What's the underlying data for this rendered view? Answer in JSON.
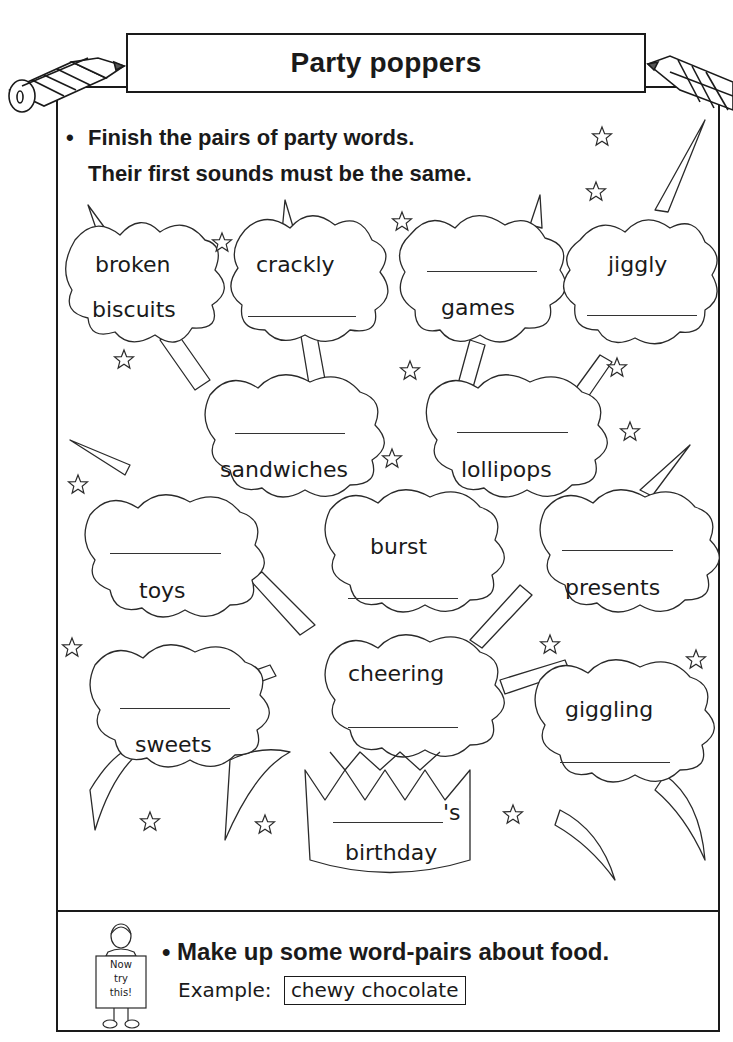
{
  "header": {
    "title": "Party poppers"
  },
  "instructions": {
    "bullet": "•",
    "line1": "Finish the pairs of party words.",
    "line2": "Their first sounds must be the same."
  },
  "bursts": [
    {
      "id": "broken-biscuits",
      "words": [
        "broken",
        "biscuits"
      ],
      "blank": null
    },
    {
      "id": "crackly",
      "words": [
        "crackly"
      ],
      "blank": "second"
    },
    {
      "id": "games",
      "words": [
        "games"
      ],
      "blank": "first"
    },
    {
      "id": "jiggly",
      "words": [
        "jiggly"
      ],
      "blank": "second"
    },
    {
      "id": "sandwiches",
      "words": [
        "sandwiches"
      ],
      "blank": "first"
    },
    {
      "id": "lollipops",
      "words": [
        "lollipops"
      ],
      "blank": "first"
    },
    {
      "id": "toys",
      "words": [
        "toys"
      ],
      "blank": "first"
    },
    {
      "id": "burst",
      "words": [
        "burst"
      ],
      "blank": "second"
    },
    {
      "id": "presents",
      "words": [
        "presents"
      ],
      "blank": "first"
    },
    {
      "id": "sweets",
      "words": [
        "sweets"
      ],
      "blank": "first"
    },
    {
      "id": "cheering",
      "words": [
        "cheering"
      ],
      "blank": "second"
    },
    {
      "id": "giggling",
      "words": [
        "giggling"
      ],
      "blank": "second"
    },
    {
      "id": "birthday",
      "words": [
        "'s",
        "birthday"
      ],
      "blank": "first"
    }
  ],
  "extension": {
    "sign_text": [
      "Now",
      "try",
      "this!"
    ],
    "bullet": "•",
    "task": "Make up some word-pairs about food.",
    "example_label": "Example:",
    "example_value": "chewy chocolate"
  },
  "icons": {
    "left_decoration": "pencil-icon",
    "right_decoration": "pencil-icon",
    "stars": "star-icon",
    "hat": "party-hat-icon",
    "mascot": "child-holding-sign-icon"
  }
}
